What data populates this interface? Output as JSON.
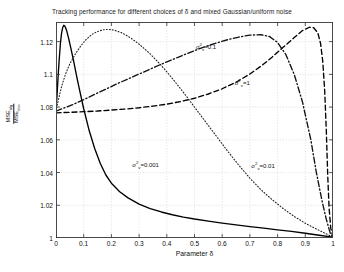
{
  "chart_data": {
    "type": "line",
    "title": "Tracking performance for different choices of δ and mixed Gaussian/uniform noise",
    "xlabel": "Parameter δ",
    "ylabel_numerator": "MSE",
    "ylabel_numerator_sub": "alg",
    "ylabel_denominator": "MSE",
    "ylabel_denominator_sub": "min",
    "xlim": [
      0,
      1
    ],
    "ylim": [
      1,
      1.132
    ],
    "grid": true,
    "legend_position": "inline-annotations",
    "xticks": [
      "0",
      "0.1",
      "0.2",
      "0.3",
      "0.4",
      "0.5",
      "0.6",
      "0.7",
      "0.8",
      "0.9",
      "1"
    ],
    "xtick_values": [
      0,
      0.1,
      0.2,
      0.3,
      0.4,
      0.5,
      0.6,
      0.7,
      0.8,
      0.9,
      1
    ],
    "yticks": [
      "1",
      "1.02",
      "1.04",
      "1.06",
      "1.08",
      "1.1",
      "1.12"
    ],
    "ytick_values": [
      1,
      1.02,
      1.04,
      1.06,
      1.08,
      1.1,
      1.12
    ],
    "series": [
      {
        "name": "sigma_v^2=0.001",
        "label_base": "σ",
        "label_sup": "2",
        "label_sub": "v",
        "label_value": "=0.001",
        "style": "solid",
        "color": "#000000",
        "annotation_x": 0.275,
        "annotation_y": 1.0455,
        "points": [
          [
            0.0,
            1.0775
          ],
          [
            0.004,
            1.088
          ],
          [
            0.008,
            1.1
          ],
          [
            0.012,
            1.11
          ],
          [
            0.016,
            1.119
          ],
          [
            0.02,
            1.125
          ],
          [
            0.024,
            1.1285
          ],
          [
            0.028,
            1.13
          ],
          [
            0.032,
            1.1295
          ],
          [
            0.038,
            1.127
          ],
          [
            0.045,
            1.1225
          ],
          [
            0.055,
            1.115
          ],
          [
            0.065,
            1.107
          ],
          [
            0.075,
            1.0985
          ],
          [
            0.085,
            1.0905
          ],
          [
            0.1,
            1.079
          ],
          [
            0.12,
            1.0655
          ],
          [
            0.14,
            1.0545
          ],
          [
            0.16,
            1.0455
          ],
          [
            0.18,
            1.0385
          ],
          [
            0.2,
            1.0335
          ],
          [
            0.23,
            1.0283
          ],
          [
            0.26,
            1.0245
          ],
          [
            0.3,
            1.0207
          ],
          [
            0.34,
            1.018
          ],
          [
            0.38,
            1.0159
          ],
          [
            0.42,
            1.0142
          ],
          [
            0.46,
            1.0128
          ],
          [
            0.5,
            1.0116
          ],
          [
            0.55,
            1.0103
          ],
          [
            0.6,
            1.0091
          ],
          [
            0.65,
            1.008
          ],
          [
            0.7,
            1.007
          ],
          [
            0.75,
            1.006
          ],
          [
            0.8,
            1.005
          ],
          [
            0.85,
            1.004
          ],
          [
            0.9,
            1.0029
          ],
          [
            0.95,
            1.0017
          ],
          [
            1.0,
            1.0005
          ]
        ]
      },
      {
        "name": "sigma_v^2=0.01",
        "label_base": "σ",
        "label_sup": "2",
        "label_sub": "v",
        "label_value": "=0.01",
        "style": "dotted",
        "color": "#222222",
        "annotation_x": 0.705,
        "annotation_y": 1.0445,
        "points": [
          [
            0.0,
            1.0775
          ],
          [
            0.01,
            1.0855
          ],
          [
            0.02,
            1.0925
          ],
          [
            0.035,
            1.1005
          ],
          [
            0.05,
            1.1065
          ],
          [
            0.07,
            1.1125
          ],
          [
            0.09,
            1.1175
          ],
          [
            0.11,
            1.1215
          ],
          [
            0.13,
            1.1245
          ],
          [
            0.15,
            1.1262
          ],
          [
            0.17,
            1.1272
          ],
          [
            0.19,
            1.1275
          ],
          [
            0.21,
            1.127
          ],
          [
            0.24,
            1.1252
          ],
          [
            0.27,
            1.1222
          ],
          [
            0.3,
            1.1185
          ],
          [
            0.34,
            1.1125
          ],
          [
            0.38,
            1.1055
          ],
          [
            0.42,
            1.0975
          ],
          [
            0.46,
            1.089
          ],
          [
            0.5,
            1.08
          ],
          [
            0.54,
            1.071
          ],
          [
            0.58,
            1.062
          ],
          [
            0.62,
            1.053
          ],
          [
            0.66,
            1.0445
          ],
          [
            0.7,
            1.0365
          ],
          [
            0.74,
            1.0295
          ],
          [
            0.78,
            1.0235
          ],
          [
            0.82,
            1.018
          ],
          [
            0.86,
            1.0132
          ],
          [
            0.9,
            1.009
          ],
          [
            0.94,
            1.0055
          ],
          [
            0.97,
            1.003
          ],
          [
            1.0,
            1.0005
          ]
        ]
      },
      {
        "name": "sigma_v^2=0.1",
        "label_base": "σ",
        "label_sup": "2",
        "label_sub": "v",
        "label_value": "=0.1",
        "style": "dashdot",
        "color": "#111111",
        "annotation_x": 0.505,
        "annotation_y": 1.1175,
        "points": [
          [
            0.0,
            1.0775
          ],
          [
            0.03,
            1.0795
          ],
          [
            0.06,
            1.0815
          ],
          [
            0.1,
            1.0845
          ],
          [
            0.14,
            1.0878
          ],
          [
            0.18,
            1.091
          ],
          [
            0.22,
            1.0942
          ],
          [
            0.26,
            1.0972
          ],
          [
            0.3,
            1.1002
          ],
          [
            0.34,
            1.1032
          ],
          [
            0.38,
            1.1062
          ],
          [
            0.42,
            1.109
          ],
          [
            0.46,
            1.1118
          ],
          [
            0.5,
            1.1145
          ],
          [
            0.54,
            1.117
          ],
          [
            0.58,
            1.1192
          ],
          [
            0.62,
            1.1212
          ],
          [
            0.66,
            1.1228
          ],
          [
            0.7,
            1.124
          ],
          [
            0.74,
            1.1242
          ],
          [
            0.77,
            1.1232
          ],
          [
            0.8,
            1.1195
          ],
          [
            0.83,
            1.112
          ],
          [
            0.86,
            1.1
          ],
          [
            0.89,
            1.083
          ],
          [
            0.92,
            1.06
          ],
          [
            0.94,
            1.04
          ],
          [
            0.96,
            1.023
          ],
          [
            0.975,
            1.012
          ],
          [
            0.99,
            1.003
          ],
          [
            1.0,
            1.0005
          ]
        ]
      },
      {
        "name": "sigma_v^2=1",
        "label_base": "σ",
        "label_sup": "2",
        "label_sub": "v",
        "label_value": "=1",
        "style": "dashed",
        "color": "#000000",
        "annotation_x": 0.645,
        "annotation_y": 1.0955,
        "points": [
          [
            0.0,
            1.0765
          ],
          [
            0.05,
            1.0768
          ],
          [
            0.1,
            1.0772
          ],
          [
            0.15,
            1.0776
          ],
          [
            0.2,
            1.0782
          ],
          [
            0.25,
            1.0788
          ],
          [
            0.3,
            1.0796
          ],
          [
            0.35,
            1.0806
          ],
          [
            0.4,
            1.0818
          ],
          [
            0.45,
            1.0834
          ],
          [
            0.5,
            1.0854
          ],
          [
            0.55,
            1.088
          ],
          [
            0.6,
            1.0912
          ],
          [
            0.65,
            1.0952
          ],
          [
            0.7,
            1.1002
          ],
          [
            0.74,
            1.105
          ],
          [
            0.78,
            1.1105
          ],
          [
            0.82,
            1.1165
          ],
          [
            0.86,
            1.1225
          ],
          [
            0.89,
            1.1268
          ],
          [
            0.915,
            1.1288
          ],
          [
            0.93,
            1.1285
          ],
          [
            0.945,
            1.1255
          ],
          [
            0.955,
            1.119
          ],
          [
            0.963,
            1.108
          ],
          [
            0.97,
            1.09
          ],
          [
            0.976,
            1.065
          ],
          [
            0.981,
            1.038
          ],
          [
            0.986,
            1.018
          ],
          [
            0.992,
            1.006
          ],
          [
            1.0,
            1.0005
          ]
        ]
      }
    ]
  }
}
